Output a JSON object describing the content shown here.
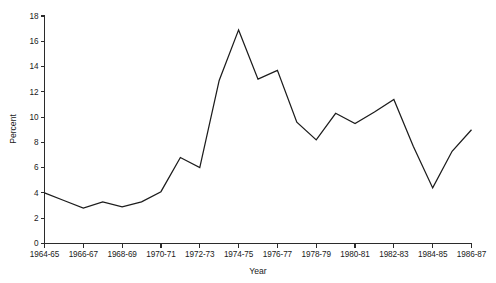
{
  "chart_data": {
    "type": "line",
    "title": "",
    "xlabel": "Year",
    "ylabel": "Percent",
    "grid": false,
    "legend": "none",
    "ylim": [
      0,
      18
    ],
    "yticks": [
      0,
      2,
      4,
      6,
      8,
      10,
      12,
      14,
      16,
      18
    ],
    "ytick_labels": [
      "0",
      "2",
      "4",
      "6",
      "8",
      "10",
      "12",
      "14",
      "16",
      "18"
    ],
    "x_tick_labels": [
      "1964-65",
      "1966-67",
      "1968-69",
      "1970-71",
      "1972-73",
      "1974-75",
      "1976-77",
      "1978-79",
      "1980-81",
      "1982-83",
      "1984-85",
      "1986-87"
    ],
    "categories": [
      "1964-65",
      "1965-66",
      "1966-67",
      "1967-68",
      "1968-69",
      "1969-70",
      "1970-71",
      "1971-72",
      "1972-73",
      "1973-74",
      "1974-75",
      "1975-76",
      "1976-77",
      "1977-78",
      "1978-79",
      "1979-80",
      "1980-81",
      "1981-82",
      "1982-83",
      "1983-84",
      "1984-85",
      "1985-86",
      "1986-87"
    ],
    "values": [
      4.0,
      3.4,
      2.8,
      3.3,
      2.9,
      3.3,
      4.1,
      6.8,
      6.0,
      12.9,
      16.9,
      13.0,
      13.7,
      9.6,
      8.2,
      10.3,
      9.5,
      10.4,
      11.4,
      7.7,
      4.4,
      7.3,
      9.0
    ],
    "series": [
      {
        "name": "Percent",
        "color": "#1c1c1c",
        "values": [
          4.0,
          3.4,
          2.8,
          3.3,
          2.9,
          3.3,
          4.1,
          6.8,
          6.0,
          12.9,
          16.9,
          13.0,
          13.7,
          9.6,
          8.2,
          10.3,
          9.5,
          10.4,
          11.4,
          7.7,
          4.4,
          7.3,
          9.0
        ]
      }
    ]
  },
  "axes": {
    "y_title": "Percent",
    "x_title": "Year"
  }
}
